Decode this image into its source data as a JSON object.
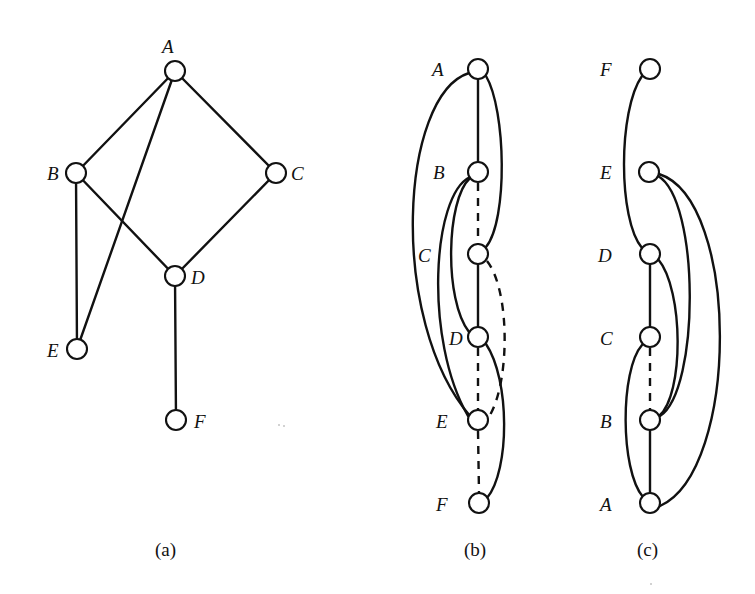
{
  "figure": {
    "panels": [
      {
        "id": "a",
        "caption": "(a)",
        "nodes": [
          {
            "id": "A",
            "label": "A"
          },
          {
            "id": "B",
            "label": "B"
          },
          {
            "id": "C",
            "label": "C"
          },
          {
            "id": "D",
            "label": "D"
          },
          {
            "id": "E",
            "label": "E"
          },
          {
            "id": "F",
            "label": "F"
          }
        ],
        "edges": [
          {
            "from": "A",
            "to": "B",
            "style": "solid"
          },
          {
            "from": "A",
            "to": "C",
            "style": "solid"
          },
          {
            "from": "A",
            "to": "E",
            "style": "solid"
          },
          {
            "from": "B",
            "to": "D",
            "style": "solid"
          },
          {
            "from": "B",
            "to": "E",
            "style": "solid"
          },
          {
            "from": "C",
            "to": "D",
            "style": "solid"
          },
          {
            "from": "D",
            "to": "F",
            "style": "solid"
          }
        ]
      },
      {
        "id": "b",
        "caption": "(b)",
        "order": [
          "A",
          "B",
          "C",
          "D",
          "E",
          "F"
        ],
        "nodes": [
          {
            "id": "A",
            "label": "A"
          },
          {
            "id": "B",
            "label": "B"
          },
          {
            "id": "C",
            "label": "C"
          },
          {
            "id": "D",
            "label": "D"
          },
          {
            "id": "E",
            "label": "E"
          },
          {
            "id": "F",
            "label": "F"
          }
        ],
        "edges": [
          {
            "from": "A",
            "to": "B",
            "style": "solid"
          },
          {
            "from": "B",
            "to": "C",
            "style": "dashed"
          },
          {
            "from": "C",
            "to": "D",
            "style": "solid"
          },
          {
            "from": "D",
            "to": "E",
            "style": "dashed"
          },
          {
            "from": "E",
            "to": "F",
            "style": "dashed"
          },
          {
            "from": "A",
            "to": "C",
            "style": "solid",
            "side": "right"
          },
          {
            "from": "A",
            "to": "E",
            "style": "solid",
            "side": "left"
          },
          {
            "from": "B",
            "to": "D",
            "style": "solid",
            "side": "left"
          },
          {
            "from": "B",
            "to": "E",
            "style": "solid",
            "side": "left"
          },
          {
            "from": "C",
            "to": "E",
            "style": "dashed",
            "side": "right"
          },
          {
            "from": "D",
            "to": "F",
            "style": "solid",
            "side": "right"
          }
        ]
      },
      {
        "id": "c",
        "caption": "(c)",
        "order": [
          "F",
          "E",
          "D",
          "C",
          "B",
          "A"
        ],
        "nodes": [
          {
            "id": "F",
            "label": "F"
          },
          {
            "id": "E",
            "label": "E"
          },
          {
            "id": "D",
            "label": "D"
          },
          {
            "id": "C",
            "label": "C"
          },
          {
            "id": "B",
            "label": "B"
          },
          {
            "id": "A",
            "label": "A"
          }
        ],
        "edges": [
          {
            "from": "D",
            "to": "C",
            "style": "solid"
          },
          {
            "from": "C",
            "to": "B",
            "style": "dashed"
          },
          {
            "from": "B",
            "to": "A",
            "style": "solid"
          },
          {
            "from": "F",
            "to": "D",
            "style": "solid",
            "side": "left"
          },
          {
            "from": "C",
            "to": "A",
            "style": "solid",
            "side": "left"
          },
          {
            "from": "D",
            "to": "B",
            "style": "solid",
            "side": "right"
          },
          {
            "from": "E",
            "to": "B",
            "style": "solid",
            "side": "right"
          },
          {
            "from": "E",
            "to": "A",
            "style": "solid",
            "side": "right"
          }
        ]
      }
    ]
  }
}
